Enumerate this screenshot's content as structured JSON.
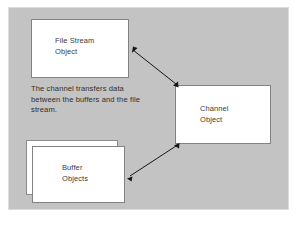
{
  "diagram": {
    "background_color": "#ffffff",
    "panel_color": "#c3c3c3",
    "box_fill_color": "#ffffff",
    "box_border_color": "#828282",
    "text_color": "#3d3d3d",
    "arrow_color": "#161616",
    "nodes": [
      {
        "id": "file-stream",
        "label": "File Stream\nObject",
        "line1": "File Stream",
        "line2": "Object"
      },
      {
        "id": "channel",
        "label": "Channel\nObject",
        "line1": "Channel",
        "line2": "Object"
      },
      {
        "id": "buffer",
        "label": "Buffer\nObjects",
        "line1": "Buffer",
        "line2": "Objects"
      }
    ],
    "note": "The channel transfers data between the buffers and the file stream.",
    "connectors": [
      {
        "id": "file-stream-to-channel",
        "from": "file-stream",
        "to": "channel",
        "style": "double-headed-arrow"
      },
      {
        "id": "buffer-to-channel",
        "from": "buffer",
        "to": "channel",
        "style": "double-headed-arrow"
      }
    ]
  }
}
